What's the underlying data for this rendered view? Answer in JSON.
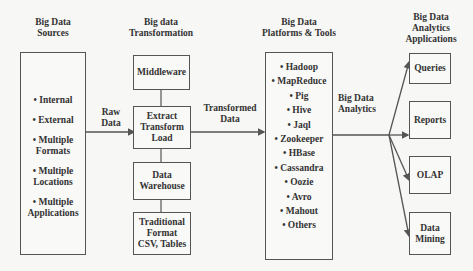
{
  "headers": {
    "sources": [
      "Big Data",
      "Sources"
    ],
    "transformation": [
      "Big data",
      "Transformation"
    ],
    "platforms": [
      "Big Data",
      "Platforms & Tools"
    ],
    "applications": [
      "Big Data",
      "Analytics",
      "Applications"
    ]
  },
  "sources": {
    "items": [
      [
        "• Internal"
      ],
      [
        "• External"
      ],
      [
        "• Multiple",
        "Formats"
      ],
      [
        "• Multiple",
        "Locations"
      ],
      [
        "• Multiple",
        "Applications"
      ]
    ]
  },
  "edges": {
    "raw_data": [
      "Raw",
      "Data"
    ],
    "transformed_data": [
      "Transformed",
      "Data"
    ],
    "big_data_analytics": [
      "Big Data",
      "Analytics"
    ]
  },
  "transformation": {
    "boxes": [
      [
        "Middleware"
      ],
      [
        "Extract",
        "Transform",
        "Load"
      ],
      [
        "Data",
        "Warehouse"
      ],
      [
        "Traditional",
        "Format",
        "CSV, Tables"
      ]
    ]
  },
  "platforms": {
    "items": [
      "• Hadoop",
      "• MapReduce",
      "• Pig",
      "• Hive",
      "• Jaql",
      "• Zookeeper",
      "• HBase",
      "• Cassandra",
      "• Oozie",
      "• Avro",
      "• Mahout",
      "• Others"
    ]
  },
  "applications": {
    "boxes": [
      [
        "Queries"
      ],
      [
        "Reports"
      ],
      [
        "OLAP"
      ],
      [
        "Data",
        "Mining"
      ]
    ]
  },
  "colors": {
    "line": "#555555",
    "background": "#f7f7f5",
    "text": "#333333"
  }
}
